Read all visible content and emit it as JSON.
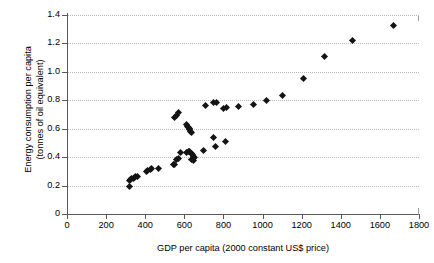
{
  "chart_data": {
    "type": "scatter",
    "title": "",
    "xlabel": "GDP per capita (2000 constant US$ price)",
    "ylabel": "Energy consumption per capita\n(tonnes of oil equivalent)",
    "xlim": [
      0,
      1800
    ],
    "ylim": [
      0,
      1.4
    ],
    "xticks": [
      "0",
      "200",
      "400",
      "600",
      "800",
      "1000",
      "1200",
      "1400",
      "1600",
      "1800"
    ],
    "xtick_values": [
      0,
      200,
      400,
      600,
      800,
      1000,
      1200,
      1400,
      1600,
      1800
    ],
    "yticks": [
      "0",
      "0.2",
      "0.4",
      "0.6",
      "0.8",
      "1.0",
      "1.2",
      "1.4"
    ],
    "ytick_values": [
      0,
      0.2,
      0.4,
      0.6,
      0.8,
      1.0,
      1.2,
      1.4
    ],
    "grid": "horizontal-dotted",
    "legend": null,
    "marker": "filled-diamond",
    "marker_color": "#141414",
    "series": [
      {
        "name": "countries",
        "points": [
          [
            320,
            0.19
          ],
          [
            318,
            0.238
          ],
          [
            325,
            0.243
          ],
          [
            330,
            0.248
          ],
          [
            338,
            0.252
          ],
          [
            345,
            0.258
          ],
          [
            352,
            0.262
          ],
          [
            358,
            0.265
          ],
          [
            405,
            0.3
          ],
          [
            412,
            0.305
          ],
          [
            425,
            0.315
          ],
          [
            432,
            0.318
          ],
          [
            470,
            0.322
          ],
          [
            545,
            0.345
          ],
          [
            552,
            0.35
          ],
          [
            560,
            0.382
          ],
          [
            572,
            0.388
          ],
          [
            578,
            0.432
          ],
          [
            548,
            0.682
          ],
          [
            560,
            0.69
          ],
          [
            572,
            0.712
          ],
          [
            610,
            0.628
          ],
          [
            615,
            0.618
          ],
          [
            620,
            0.608
          ],
          [
            624,
            0.6
          ],
          [
            628,
            0.592
          ],
          [
            632,
            0.582
          ],
          [
            636,
            0.572
          ],
          [
            612,
            0.432
          ],
          [
            620,
            0.438
          ],
          [
            628,
            0.442
          ],
          [
            636,
            0.428
          ],
          [
            640,
            0.418
          ],
          [
            645,
            0.408
          ],
          [
            650,
            0.4
          ],
          [
            638,
            0.382
          ],
          [
            648,
            0.378
          ],
          [
            710,
            0.762
          ],
          [
            700,
            0.448
          ],
          [
            748,
            0.535
          ],
          [
            758,
            0.472
          ],
          [
            812,
            0.512
          ],
          [
            748,
            0.785
          ],
          [
            762,
            0.782
          ],
          [
            800,
            0.745
          ],
          [
            818,
            0.748
          ],
          [
            875,
            0.758
          ],
          [
            952,
            0.772
          ],
          [
            1018,
            0.795
          ],
          [
            1102,
            0.832
          ],
          [
            1208,
            0.955
          ],
          [
            1318,
            1.105
          ],
          [
            1458,
            1.222
          ],
          [
            1668,
            1.328
          ]
        ]
      }
    ]
  }
}
